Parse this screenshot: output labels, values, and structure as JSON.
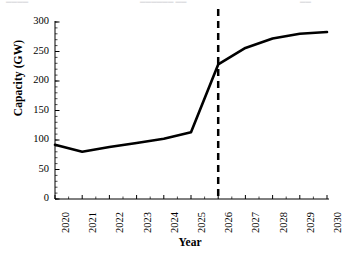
{
  "top_edge_fragment": {
    "left": "▁▁▁▁",
    "center": "▁▁▁▁▁▁ ▁▁",
    "right": "▁▁"
  },
  "chart_data": {
    "type": "line",
    "title": "",
    "xlabel": "Year",
    "ylabel": "Capacity (GW)",
    "categories": [
      "2020",
      "2021",
      "2022",
      "2023",
      "2024",
      "2025",
      "2026",
      "2027",
      "2028",
      "2029",
      "2030"
    ],
    "x": [
      2020,
      2021,
      2022,
      2023,
      2024,
      2025,
      2026,
      2027,
      2028,
      2029,
      2030
    ],
    "series": [
      {
        "name": "Capacity",
        "color": "#000000",
        "values": [
          92,
          80,
          88,
          95,
          102,
          113,
          228,
          256,
          272,
          280,
          283
        ]
      }
    ],
    "xlim": [
      2020,
      2030
    ],
    "ylim": [
      0,
      300
    ],
    "yticks": [
      0,
      50,
      100,
      150,
      200,
      250,
      300
    ],
    "ytick_labels": [
      "0",
      "50",
      "100",
      "150",
      "200",
      "250",
      "300"
    ],
    "y_minor_tick_step": 10,
    "xtick_rotation": 90,
    "grid": false,
    "legend": false,
    "legend_position": "none",
    "annotations": [
      {
        "type": "vertical-dashed-line",
        "x": 2026,
        "color": "#000000",
        "dash": "7,5",
        "width": 2.5,
        "label": ""
      }
    ]
  }
}
